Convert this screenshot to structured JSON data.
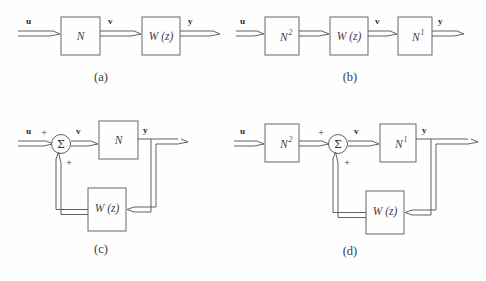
{
  "figure": {
    "background_color": "#fefefe",
    "line_color": "#58585f",
    "block_border_color": "#6d6d75",
    "text_color": "#34343a"
  },
  "signals": {
    "input": "u",
    "intermediate": "v",
    "output": "y",
    "plus": "+",
    "sum": "Σ"
  },
  "blocks": {
    "n": "N",
    "n_base": "N",
    "n_sup2": "2",
    "n_sup1": "1",
    "w": "W (z)"
  },
  "panels": [
    {
      "id": "a",
      "caption": "(a)",
      "structure": "cascade",
      "blocks": [
        "N",
        "W (z)"
      ],
      "labels": [
        "u",
        "v",
        "y"
      ],
      "feedback": false
    },
    {
      "id": "b",
      "caption": "(b)",
      "structure": "cascade",
      "blocks": [
        "N²",
        "W (z)",
        "N¹"
      ],
      "labels": [
        "u",
        "v",
        "y"
      ],
      "feedback": false
    },
    {
      "id": "c",
      "caption": "(c)",
      "structure": "feedback",
      "blocks": [
        "N",
        "W (z)"
      ],
      "labels": [
        "u",
        "v",
        "y",
        "+",
        "+",
        "Σ"
      ],
      "feedback": true
    },
    {
      "id": "d",
      "caption": "(d)",
      "structure": "feedback",
      "blocks": [
        "N²",
        "N¹",
        "W (z)"
      ],
      "labels": [
        "u",
        "v",
        "y",
        "+",
        "+",
        "Σ"
      ],
      "feedback": true
    }
  ]
}
